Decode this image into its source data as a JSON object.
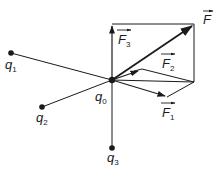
{
  "diagram": {
    "colors": {
      "ink": "#1a1a1a",
      "background": "#ffffff"
    },
    "charges": [
      {
        "id": "q0",
        "label": "q",
        "subscript": "0",
        "x": 112,
        "y": 80
      },
      {
        "id": "q1",
        "label": "q",
        "subscript": "1",
        "x": 11,
        "y": 53
      },
      {
        "id": "q2",
        "label": "q",
        "subscript": "2",
        "x": 42,
        "y": 107
      },
      {
        "id": "q3",
        "label": "q",
        "subscript": "3",
        "x": 112,
        "y": 148
      }
    ],
    "forces": [
      {
        "id": "F1",
        "label": "F",
        "subscript": "1",
        "from": "q0",
        "to_x": 167,
        "to_y": 97
      },
      {
        "id": "F2",
        "label": "F",
        "subscript": "2",
        "from": "q0",
        "to_x": 142,
        "to_y": 69
      },
      {
        "id": "F3",
        "label": "F",
        "subscript": "3",
        "from": "q0",
        "to_x": 112,
        "to_y": 24
      },
      {
        "id": "F",
        "label": "F",
        "subscript": "",
        "from": "q0",
        "to_x": 194,
        "to_y": 24,
        "resultant": true
      }
    ],
    "labels": {
      "q0": {
        "text": "q",
        "sub": "0"
      },
      "q1": {
        "text": "q",
        "sub": "1"
      },
      "q2": {
        "text": "q",
        "sub": "2"
      },
      "q3": {
        "text": "q",
        "sub": "3"
      },
      "F": {
        "text": "F",
        "sub": ""
      },
      "F1": {
        "text": "F",
        "sub": "1"
      },
      "F2": {
        "text": "F",
        "sub": "2"
      },
      "F3": {
        "text": "F",
        "sub": "3"
      }
    }
  }
}
